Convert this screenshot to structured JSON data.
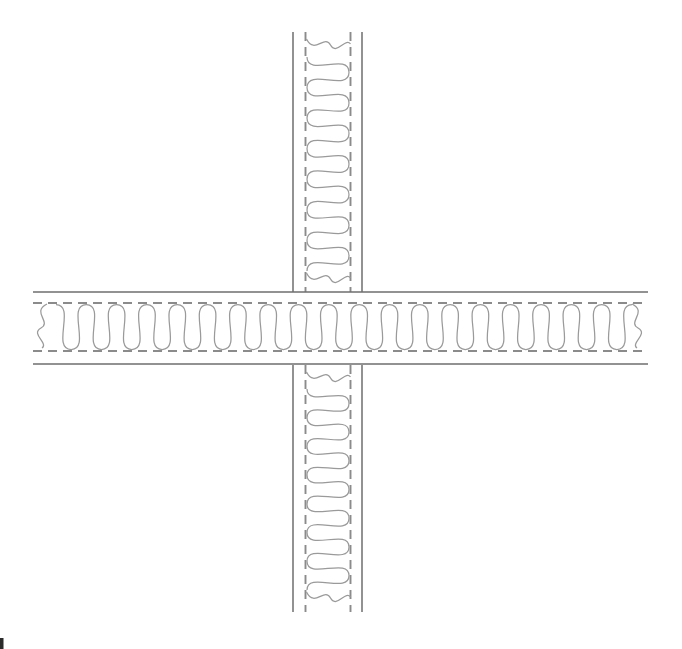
{
  "page": {
    "width": 682,
    "height": 649,
    "background": "#ffffff"
  },
  "styles": {
    "solid_line_color": "#6e6e6e",
    "solid_line_width": 1.5,
    "dashed_line_color": "#8b8b8b",
    "dashed_line_width": 1.9,
    "dash_pattern": "9 6",
    "insulation_color": "#9a9a9a",
    "insulation_width": 1.25
  },
  "insulation_pattern": {
    "period": 30,
    "loop_overshoot_ratio": 0.66,
    "inset": 1.5
  },
  "horizontal_wall": {
    "x_start": 33,
    "x_end": 648,
    "outer_face_top_y": 292,
    "outer_face_bottom_y": 364,
    "inner_dashed_top_y": 303,
    "inner_dashed_bottom_y": 351,
    "insulation_thickness": 48,
    "batt_from_x": 56,
    "batt_to_x": 632,
    "break_squiggle_x": [
      40,
      639
    ]
  },
  "vertical_wall": {
    "y_start": 32,
    "y_end": 612,
    "interrupted_from_y": 292,
    "interrupted_to_y": 365,
    "outer_face_left_x": 293,
    "outer_face_right_x": 362,
    "inner_dashed_left_x": 305.5,
    "inner_dashed_right_x": 350.5,
    "insulation_thickness": 45,
    "batt_segments": [
      {
        "from_y": 57,
        "to_y": 271
      },
      {
        "from_y": 389,
        "to_y": 590
      }
    ],
    "break_squiggle_y": [
      46,
      280,
      379,
      599
    ]
  },
  "page_mark": {
    "x": 0,
    "y": 638,
    "width": 3.5,
    "height": 11,
    "color": "#2b2b2b"
  }
}
